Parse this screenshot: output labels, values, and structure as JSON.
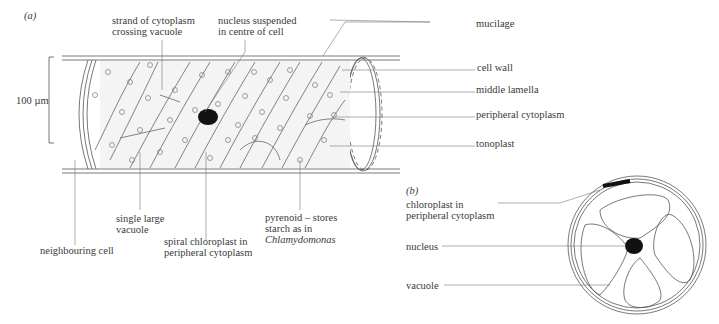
{
  "figure_a": {
    "panel_label": "(a)",
    "scale_bar": "100 µm",
    "labels": {
      "strand_line1": "strand of cytoplasm",
      "strand_line2": "crossing vacuole",
      "nucleus_line1": "nucleus suspended",
      "nucleus_line2": "in centre of cell",
      "mucilage": "mucilage",
      "cell_wall": "cell wall",
      "middle_lamella": "middle lamella",
      "peripheral_cytoplasm": "peripheral cytoplasm",
      "tonoplast": "tonoplast",
      "neighbouring_cell": "neighbouring cell",
      "vacuole_line1": "single large",
      "vacuole_line2": "vacuole",
      "chloroplast_line1": "spiral chloroplast in",
      "chloroplast_line2": "peripheral cytoplasm",
      "pyrenoid_line1": "pyrenoid – stores",
      "pyrenoid_line2": "starch as in",
      "pyrenoid_line3": "Chlamydomonas"
    }
  },
  "figure_b": {
    "panel_label": "(b)",
    "labels": {
      "chloroplast_line1": "chloroplast in",
      "chloroplast_line2": "peripheral cytoplasm",
      "nucleus": "nucleus",
      "vacuole": "vacuole"
    }
  },
  "colors": {
    "line": "#555555",
    "nucleus": "#111111",
    "background": "#ffffff"
  }
}
